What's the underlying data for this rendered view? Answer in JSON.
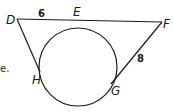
{
  "diagram": {
    "type": "geometry-tangent-circle",
    "points": {
      "D": "D",
      "E": "E",
      "F": "F",
      "G": "G",
      "H": "H"
    },
    "segment_labels": {
      "DE": "6",
      "FG": "8"
    },
    "edge_text_fragment": "e.",
    "colors": {
      "line": "#1a1a1a",
      "background": "#ffffff"
    }
  }
}
